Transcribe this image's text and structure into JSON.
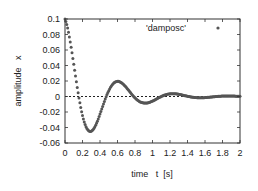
{
  "chart_data": {
    "type": "scatter",
    "title": "",
    "xlabel": "time   t  [s]",
    "ylabel": "amplitude   x",
    "xlim": [
      0,
      2
    ],
    "ylim": [
      -0.06,
      0.1
    ],
    "xticks": [
      "0",
      "0.2",
      "0.4",
      "0.6",
      "0.8",
      "1",
      "1.2",
      "1.4",
      "1.6",
      "1.8",
      "2"
    ],
    "yticks": [
      "0.1",
      "0.08",
      "0.06",
      "0.04",
      "0.02",
      "0",
      "-0.02",
      "-0.04",
      "-0.06"
    ],
    "grid": false,
    "zero_line": true,
    "legend": {
      "position": "top-right",
      "entries": [
        "'damposc'"
      ]
    },
    "series": [
      {
        "name": "'damposc'",
        "marker": "dot",
        "color": "#555555",
        "model": "x = 0.1 * exp(-2.65 t) * cos(10 t)",
        "key_points": [
          {
            "t": 0.0,
            "x": 0.1
          },
          {
            "t": 0.16,
            "x": 0.0
          },
          {
            "t": 0.32,
            "x": -0.043
          },
          {
            "t": 0.47,
            "x": 0.0
          },
          {
            "t": 0.63,
            "x": 0.019
          },
          {
            "t": 0.79,
            "x": 0.0
          },
          {
            "t": 0.95,
            "x": -0.008
          },
          {
            "t": 1.1,
            "x": 0.0
          },
          {
            "t": 1.27,
            "x": 0.0035
          },
          {
            "t": 1.58,
            "x": -0.0015
          },
          {
            "t": 2.0,
            "x": 0.0
          }
        ],
        "gamma": 2.65,
        "omega": 10,
        "amplitude": 0.1,
        "n_points": 200
      }
    ]
  }
}
